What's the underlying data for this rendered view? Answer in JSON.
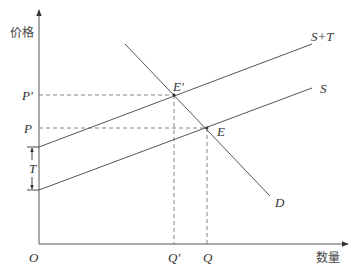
{
  "diagram": {
    "title": "",
    "axes": {
      "y_label": "价格",
      "x_label": "数量",
      "origin": "O"
    },
    "price_ticks": {
      "p_prime": "P'",
      "p": "P"
    },
    "quantity_ticks": {
      "q_prime": "Q'",
      "q": "Q"
    },
    "curves": {
      "supply_plus_tax": "S+T",
      "supply": "S",
      "demand": "D"
    },
    "points": {
      "e_prime": "E'",
      "e": "E"
    },
    "tax_label": "T",
    "colors": {
      "line": "#555555",
      "dashed": "#777777"
    }
  }
}
